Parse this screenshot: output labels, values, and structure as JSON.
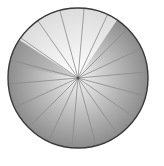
{
  "diagram": {
    "type": "segmented-circle",
    "center": [
      78,
      78
    ],
    "radius": 70,
    "spoke_count": 18,
    "highlight_wedge": {
      "start_deg": -147,
      "end_deg": -56
    },
    "colors": {
      "outline": "#3a3a3a",
      "spoke": "#8a8a8a",
      "base_inner": "#f2f2f2",
      "base_outer": "#8c8c8c",
      "highlight_inner": "#ffffff",
      "highlight_outer": "#dcdcdc",
      "shadow_wedge": "#9a9a9a"
    }
  }
}
